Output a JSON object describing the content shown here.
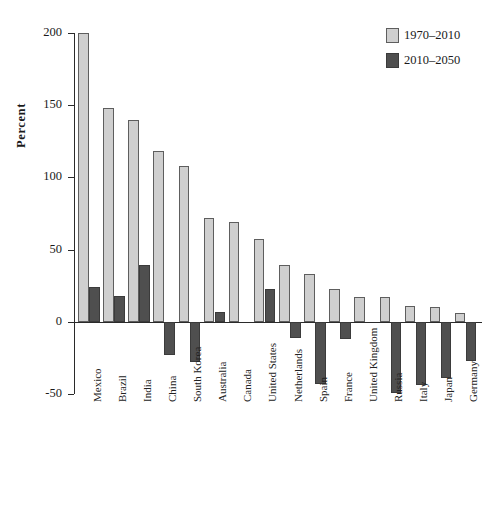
{
  "chart_data": {
    "type": "bar",
    "title": "",
    "xlabel": "",
    "ylabel": "Percent",
    "ylim": [
      -50,
      200
    ],
    "yticks": [
      200,
      150,
      100,
      50,
      0,
      -50
    ],
    "ytick_labels": [
      "200",
      "150",
      "100",
      "50",
      "0",
      "-50"
    ],
    "grid": false,
    "legend_position": "top-right",
    "categories": [
      "Mexico",
      "Brazil",
      "India",
      "China",
      "South Korea",
      "Australia",
      "Canada",
      "United States",
      "Netherlands",
      "Spain",
      "France",
      "United Kingdom",
      "Russia",
      "Italy",
      "Japan",
      "Germany"
    ],
    "series": [
      {
        "name": "1970–2010",
        "color": "#cfcfcf",
        "values": [
          200,
          148,
          140,
          118,
          108,
          72,
          69,
          57,
          39,
          33,
          23,
          17,
          17,
          11,
          10,
          6
        ]
      },
      {
        "name": "2010–2050",
        "color": "#4f4f4f",
        "values": [
          24,
          18,
          39,
          -23,
          -28,
          7,
          0,
          23,
          -11,
          -43,
          -12,
          0,
          -49,
          -44,
          -39,
          -27
        ]
      }
    ]
  },
  "legend": {
    "items": [
      {
        "label": "1970–2010",
        "swatch": "light"
      },
      {
        "label": "2010–2050",
        "swatch": "dark"
      }
    ]
  },
  "axis": {
    "y_title": "Percent"
  }
}
